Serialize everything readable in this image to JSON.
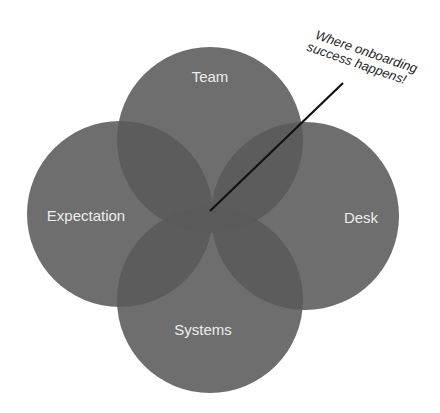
{
  "diagram": {
    "type": "venn",
    "circles": [
      {
        "id": "team",
        "label": "Team",
        "cx": 210,
        "cy": 140,
        "r": 93
      },
      {
        "id": "expectation",
        "label": "Expectation",
        "cx": 120,
        "cy": 214,
        "r": 93
      },
      {
        "id": "desk",
        "label": "Desk",
        "cx": 305,
        "cy": 216,
        "r": 94
      },
      {
        "id": "systems",
        "label": "Systems",
        "cx": 210,
        "cy": 300,
        "r": 93
      }
    ],
    "fill_color": "#6a6a6a",
    "overlap_opacity": 0.75,
    "callout": {
      "line1": "Where onboarding",
      "line2": "success happens!",
      "pointer_from": [
        343,
        83
      ],
      "pointer_to": [
        210,
        211
      ]
    }
  }
}
